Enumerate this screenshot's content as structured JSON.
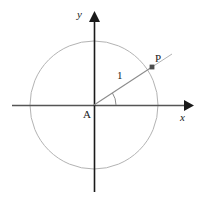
{
  "figure": {
    "background_color": "#ffffff"
  },
  "labels": {
    "y_axis": "y",
    "x_axis": "x",
    "origin": "A",
    "point": "P",
    "radius": "1"
  },
  "colors": {
    "axis": "#555555",
    "circle": "#b3b3b3",
    "radius_line": "#8c8c8c",
    "arc": "#8c8c8c",
    "marker": "#4d4d4d",
    "text": "#1a1a1a"
  },
  "geometry": {
    "center": {
      "x": 94,
      "y": 105
    },
    "radius_px": 64,
    "point_P": {
      "x": 152,
      "y": 67
    },
    "angle_degrees": 33,
    "x_axis": {
      "start_x": 12,
      "end_x": 190,
      "y": 105
    },
    "y_axis": {
      "x": 94,
      "start_y": 12,
      "end_y": 192
    },
    "angle_arc_radius_px": 22,
    "tangent_segment": {
      "x1": 152,
      "y1": 67,
      "x2": 172,
      "y2": 54
    }
  },
  "chart_data": {
    "type": "scatter",
    "xlabel": "x",
    "ylabel": "y",
    "series": [
      {
        "name": "P",
        "x": [
          0.906
        ],
        "y": [
          0.594
        ],
        "label": "P"
      }
    ],
    "annotations": [
      {
        "text": "A",
        "role": "origin"
      },
      {
        "text": "1",
        "role": "radius-length"
      },
      {
        "text": "P",
        "role": "point-on-circle"
      }
    ],
    "grid": false,
    "legend": "none"
  }
}
